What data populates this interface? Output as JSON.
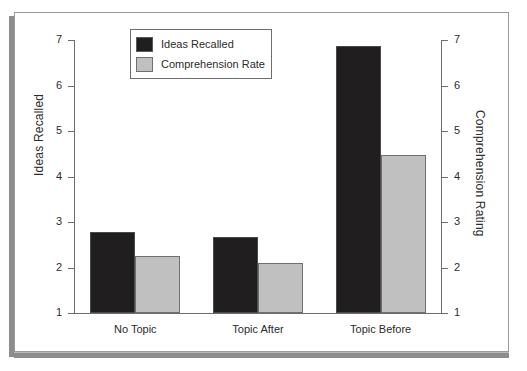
{
  "chart_data": {
    "type": "bar",
    "title": "",
    "subtitle": "",
    "categories": [
      "No Topic",
      "Topic After",
      "Topic Before"
    ],
    "series": [
      {
        "name": "Ideas Recalled",
        "color": "#201e1e",
        "axis": "left",
        "values": [
          2.77,
          2.66,
          6.86
        ]
      },
      {
        "name": "Comprehension Rate",
        "color": "#c0c0c0",
        "axis": "right",
        "values": [
          2.26,
          2.09,
          4.47
        ]
      }
    ],
    "xlabel": "",
    "ylabel": "Ideas Recalled",
    "y2label": "Comprehension Rating",
    "ylim": [
      1,
      7
    ],
    "y2lim": [
      1,
      7
    ],
    "yticks": [
      7,
      6,
      5,
      4,
      3,
      2,
      1
    ],
    "y2ticks": [
      7,
      6,
      5,
      4,
      3,
      2,
      1
    ],
    "grid": false,
    "legend_position": "top-left-inside",
    "bar_edge_color": "#6d6d6d",
    "axis_color": "#6d6d6d",
    "background": "#ffffff"
  },
  "figure": {
    "frame_border_color": "#9a9a9a",
    "shadow_color": "#8d8d8d"
  },
  "legend": {
    "items": [
      {
        "label": "Ideas Recalled",
        "swatch": "dark-swatch-icon"
      },
      {
        "label": "Comprehension Rate",
        "swatch": "light-swatch-icon"
      }
    ]
  }
}
